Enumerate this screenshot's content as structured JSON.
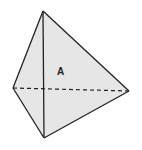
{
  "diagram": {
    "type": "tetrahedron",
    "label": "A",
    "vertices": {
      "top": [
        43,
        11
      ],
      "left": [
        13,
        88
      ],
      "right": [
        129,
        91
      ],
      "bottom": [
        44,
        138
      ]
    },
    "colors": {
      "fill": "#e6e6e6",
      "stroke": "#222222",
      "background": "#ffffff"
    }
  }
}
